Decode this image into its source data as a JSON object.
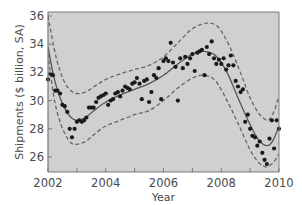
{
  "chart_data": {
    "type": "scatter",
    "title": "",
    "xlabel": "Year",
    "ylabel": "Shipments ($ billion, SA)",
    "xlim": [
      2002,
      2010
    ],
    "ylim": [
      25.2,
      36.3
    ],
    "x_ticks": [
      2002,
      2004,
      2006,
      2008,
      2010
    ],
    "x_minor_ticks": [
      2003,
      2005,
      2007,
      2009
    ],
    "y_ticks": [
      26,
      28,
      30,
      32,
      34,
      36
    ],
    "grid": false,
    "legend": null,
    "colors": {
      "plot_background": "#cfd0d1",
      "points": "#1a1a1a",
      "fit_line": "#555555",
      "band_lines": "#666666",
      "axis": "#7a7a7a",
      "text": "#4a4a4a"
    },
    "series": [
      {
        "name": "Observed shipments",
        "kind": "scatter",
        "points": [
          [
            2002.0,
            31.5
          ],
          [
            2002.08,
            31.9
          ],
          [
            2002.17,
            31.8
          ],
          [
            2002.25,
            30.7
          ],
          [
            2002.33,
            30.7
          ],
          [
            2002.42,
            30.5
          ],
          [
            2002.5,
            29.7
          ],
          [
            2002.58,
            29.6
          ],
          [
            2002.67,
            29.2
          ],
          [
            2002.75,
            28.0
          ],
          [
            2002.83,
            27.4
          ],
          [
            2002.92,
            28.0
          ],
          [
            2003.0,
            28.5
          ],
          [
            2003.08,
            28.6
          ],
          [
            2003.17,
            28.5
          ],
          [
            2003.25,
            28.6
          ],
          [
            2003.33,
            28.8
          ],
          [
            2003.42,
            29.5
          ],
          [
            2003.5,
            29.5
          ],
          [
            2003.58,
            29.5
          ],
          [
            2003.67,
            29.9
          ],
          [
            2003.75,
            30.2
          ],
          [
            2003.83,
            30.3
          ],
          [
            2003.92,
            30.4
          ],
          [
            2004.0,
            30.5
          ],
          [
            2004.08,
            29.7
          ],
          [
            2004.17,
            30.0
          ],
          [
            2004.25,
            30.1
          ],
          [
            2004.33,
            30.5
          ],
          [
            2004.42,
            30.6
          ],
          [
            2004.5,
            30.3
          ],
          [
            2004.58,
            30.7
          ],
          [
            2004.67,
            31.0
          ],
          [
            2004.75,
            30.9
          ],
          [
            2004.83,
            30.8
          ],
          [
            2004.92,
            31.2
          ],
          [
            2005.0,
            31.3
          ],
          [
            2005.08,
            31.6
          ],
          [
            2005.17,
            31.2
          ],
          [
            2005.25,
            30.1
          ],
          [
            2005.33,
            31.4
          ],
          [
            2005.42,
            31.5
          ],
          [
            2005.5,
            29.9
          ],
          [
            2005.58,
            30.6
          ],
          [
            2005.67,
            31.8
          ],
          [
            2005.75,
            31.6
          ],
          [
            2005.83,
            32.3
          ],
          [
            2005.92,
            30.1
          ],
          [
            2006.0,
            32.8
          ],
          [
            2006.08,
            33.0
          ],
          [
            2006.17,
            32.8
          ],
          [
            2006.25,
            34.1
          ],
          [
            2006.33,
            32.7
          ],
          [
            2006.42,
            32.4
          ],
          [
            2006.5,
            30.0
          ],
          [
            2006.58,
            33.0
          ],
          [
            2006.67,
            32.3
          ],
          [
            2006.75,
            33.1
          ],
          [
            2006.83,
            32.6
          ],
          [
            2006.92,
            33.0
          ],
          [
            2007.0,
            33.3
          ],
          [
            2007.08,
            32.1
          ],
          [
            2007.17,
            33.4
          ],
          [
            2007.25,
            33.5
          ],
          [
            2007.33,
            33.6
          ],
          [
            2007.42,
            31.8
          ],
          [
            2007.5,
            33.8
          ],
          [
            2007.58,
            33.3
          ],
          [
            2007.67,
            34.2
          ],
          [
            2007.75,
            33.0
          ],
          [
            2007.83,
            32.6
          ],
          [
            2007.92,
            32.9
          ],
          [
            2008.0,
            32.6
          ],
          [
            2008.08,
            33.0
          ],
          [
            2008.17,
            32.2
          ],
          [
            2008.25,
            32.5
          ],
          [
            2008.33,
            33.2
          ],
          [
            2008.42,
            32.5
          ],
          [
            2008.5,
            31.4
          ],
          [
            2008.58,
            31.0
          ],
          [
            2008.67,
            30.6
          ],
          [
            2008.75,
            30.8
          ],
          [
            2008.83,
            28.5
          ],
          [
            2008.92,
            29.0
          ],
          [
            2009.0,
            28.0
          ],
          [
            2009.08,
            27.5
          ],
          [
            2009.17,
            27.4
          ],
          [
            2009.25,
            26.8
          ],
          [
            2009.33,
            27.1
          ],
          [
            2009.42,
            26.3
          ],
          [
            2009.5,
            25.8
          ],
          [
            2009.58,
            25.5
          ],
          [
            2009.67,
            27.3
          ],
          [
            2009.75,
            28.6
          ],
          [
            2009.83,
            26.6
          ],
          [
            2009.92,
            28.6
          ],
          [
            2010.0,
            28.0
          ]
        ]
      },
      {
        "name": "Fitted trend",
        "kind": "line",
        "style": "solid",
        "points": [
          [
            2002.0,
            33.8
          ],
          [
            2002.2,
            31.7
          ],
          [
            2002.4,
            30.3
          ],
          [
            2002.6,
            29.4
          ],
          [
            2002.8,
            28.8
          ],
          [
            2003.0,
            28.6
          ],
          [
            2003.3,
            28.8
          ],
          [
            2003.6,
            29.3
          ],
          [
            2004.0,
            29.9
          ],
          [
            2004.5,
            30.4
          ],
          [
            2005.0,
            30.8
          ],
          [
            2005.5,
            31.2
          ],
          [
            2006.0,
            31.8
          ],
          [
            2006.5,
            32.6
          ],
          [
            2007.0,
            33.3
          ],
          [
            2007.4,
            33.5
          ],
          [
            2007.8,
            33.2
          ],
          [
            2008.2,
            32.0
          ],
          [
            2008.6,
            30.1
          ],
          [
            2009.0,
            28.3
          ],
          [
            2009.3,
            27.2
          ],
          [
            2009.6,
            26.8
          ],
          [
            2009.8,
            27.2
          ],
          [
            2010.0,
            28.2
          ]
        ]
      },
      {
        "name": "Upper band",
        "kind": "line",
        "style": "dashed",
        "points": [
          [
            2002.0,
            36.0
          ],
          [
            2002.2,
            33.8
          ],
          [
            2002.4,
            32.2
          ],
          [
            2002.6,
            31.2
          ],
          [
            2002.8,
            30.7
          ],
          [
            2003.0,
            30.5
          ],
          [
            2003.3,
            30.6
          ],
          [
            2003.6,
            31.0
          ],
          [
            2004.0,
            31.5
          ],
          [
            2004.5,
            31.9
          ],
          [
            2005.0,
            32.2
          ],
          [
            2005.5,
            32.5
          ],
          [
            2006.0,
            33.1
          ],
          [
            2006.5,
            34.1
          ],
          [
            2007.0,
            35.1
          ],
          [
            2007.5,
            35.5
          ],
          [
            2007.9,
            35.2
          ],
          [
            2008.3,
            33.8
          ],
          [
            2008.7,
            31.8
          ],
          [
            2009.0,
            30.2
          ],
          [
            2009.3,
            29.1
          ],
          [
            2009.6,
            28.6
          ],
          [
            2009.8,
            29.1
          ],
          [
            2010.0,
            30.3
          ]
        ]
      },
      {
        "name": "Lower band",
        "kind": "line",
        "style": "dashed",
        "points": [
          [
            2002.0,
            33.3
          ],
          [
            2002.2,
            30.3
          ],
          [
            2002.4,
            28.6
          ],
          [
            2002.6,
            27.6
          ],
          [
            2002.8,
            27.0
          ],
          [
            2003.0,
            26.9
          ],
          [
            2003.3,
            27.1
          ],
          [
            2003.6,
            27.6
          ],
          [
            2004.0,
            28.2
          ],
          [
            2004.5,
            28.6
          ],
          [
            2005.0,
            29.0
          ],
          [
            2005.5,
            29.3
          ],
          [
            2006.0,
            30.0
          ],
          [
            2006.5,
            30.9
          ],
          [
            2007.0,
            31.6
          ],
          [
            2007.4,
            31.8
          ],
          [
            2007.8,
            31.4
          ],
          [
            2008.2,
            30.0
          ],
          [
            2008.6,
            28.3
          ],
          [
            2009.0,
            26.5
          ],
          [
            2009.3,
            25.6
          ],
          [
            2009.55,
            25.3
          ],
          [
            2009.8,
            25.6
          ],
          [
            2010.0,
            26.2
          ]
        ]
      }
    ]
  }
}
